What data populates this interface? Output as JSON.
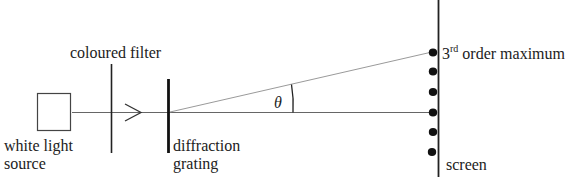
{
  "diagram": {
    "labels": {
      "source": [
        "white light",
        "source"
      ],
      "filter": "coloured filter",
      "grating": [
        "diffraction",
        "grating"
      ],
      "angle": "θ",
      "order_number": "3",
      "order_suffix": "rd",
      "order_text": " order maximum",
      "screen": "screen"
    },
    "components": [
      {
        "name": "white light source",
        "shape": "square"
      },
      {
        "name": "coloured filter",
        "shape": "vertical line"
      },
      {
        "name": "direction arrow",
        "shape": "chevron"
      },
      {
        "name": "diffraction grating",
        "shape": "thick vertical line"
      },
      {
        "name": "screen",
        "shape": "vertical line"
      }
    ],
    "maxima_dots": 6,
    "colors": {
      "line": "#333333",
      "ray": "#9a9a9a",
      "dot": "#111111"
    }
  }
}
